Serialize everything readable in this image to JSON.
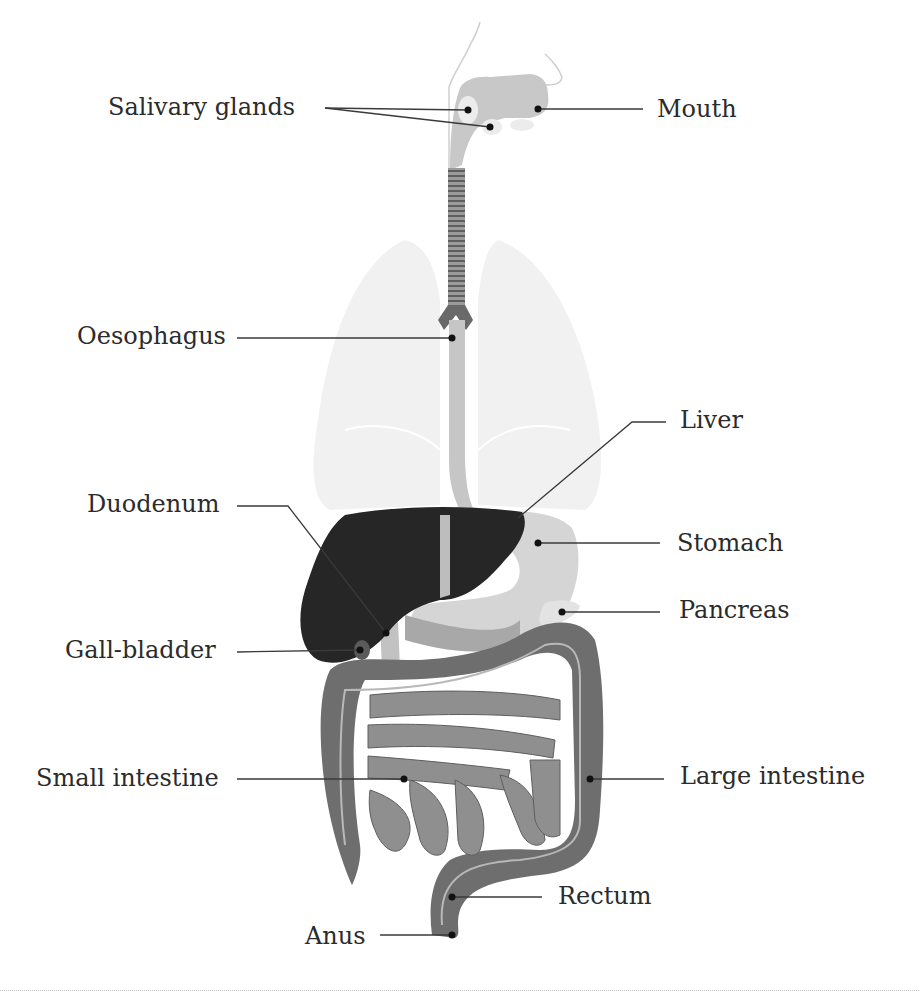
{
  "diagram": {
    "colors": {
      "lungs": "#f0f0f0",
      "head_outline": "#d0d0d0",
      "mouth": "#c8c8c8",
      "oesophagus": "#c4c4c4",
      "trachea": "#6e6e6e",
      "liver": "#2a2a2a",
      "stomach": "#d6d6d6",
      "pancreas": "#e2e2e2",
      "duodenum": "#bdbdbd",
      "large_intestine": "#6f6f6f",
      "small_intestine": "#8e8e8e",
      "leader_line": "#3a3a3a",
      "text": "#2b2b2b"
    },
    "labels": {
      "salivary_glands": "Salivary glands",
      "mouth": "Mouth",
      "oesophagus": "Oesophagus",
      "liver": "Liver",
      "duodenum": "Duodenum",
      "stomach": "Stomach",
      "pancreas": "Pancreas",
      "gall_bladder": "Gall-bladder",
      "small_intestine": "Small intestine",
      "large_intestine": "Large intestine",
      "rectum": "Rectum",
      "anus": "Anus"
    }
  }
}
